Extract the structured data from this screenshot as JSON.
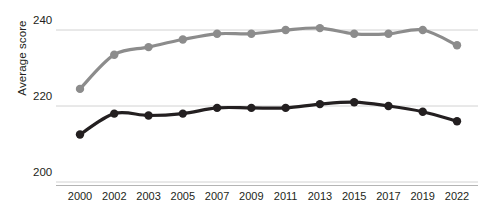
{
  "chart_data": {
    "type": "line",
    "title": "",
    "subtitle": "",
    "xlabel": "",
    "ylabel": "Average score",
    "categories": [
      "2000",
      "2002",
      "2003",
      "2005",
      "2007",
      "2009",
      "2011",
      "2013",
      "2015",
      "2017",
      "2019",
      "2022"
    ],
    "ylim": [
      196,
      243
    ],
    "yticks": [
      200,
      220,
      240
    ],
    "ytick_labels": [
      "200",
      "220",
      "240"
    ],
    "grid": "horizontal",
    "legend": "none",
    "series": [
      {
        "name": "upper-series",
        "color": "#8c8c8c",
        "marker": "circle",
        "values": [
          224.5,
          233.5,
          235.5,
          237.5,
          239.0,
          239.0,
          240.0,
          240.5,
          239.0,
          239.0,
          240.0,
          236.0
        ]
      },
      {
        "name": "lower-series",
        "color": "#231f20",
        "marker": "circle",
        "values": [
          212.5,
          218.0,
          217.5,
          218.0,
          219.5,
          219.5,
          219.5,
          220.5,
          221.0,
          220.0,
          218.5,
          216.0
        ]
      }
    ]
  },
  "axes": {
    "y_axis_title": "Average score"
  }
}
